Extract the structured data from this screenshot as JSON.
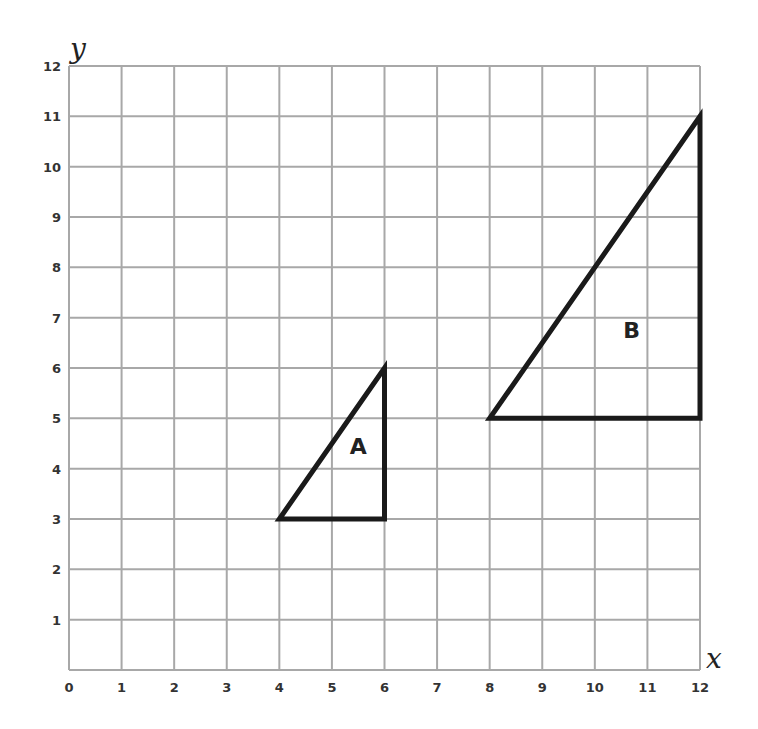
{
  "chart_data": {
    "type": "scatter",
    "title": "",
    "xlabel": "x",
    "ylabel": "y",
    "xlim": [
      0,
      12
    ],
    "ylim": [
      0,
      12
    ],
    "grid": true,
    "x_ticks": [
      "0",
      "1",
      "2",
      "3",
      "4",
      "5",
      "6",
      "7",
      "8",
      "9",
      "10",
      "11",
      "12"
    ],
    "y_ticks": [
      "1",
      "2",
      "3",
      "4",
      "5",
      "6",
      "7",
      "8",
      "9",
      "10",
      "11",
      "12"
    ],
    "shapes": [
      {
        "name": "A",
        "kind": "triangle",
        "vertices": [
          [
            4,
            3
          ],
          [
            6,
            3
          ],
          [
            6,
            6
          ]
        ],
        "label_pos": [
          5.5,
          4.3
        ]
      },
      {
        "name": "B",
        "kind": "triangle",
        "vertices": [
          [
            8,
            5
          ],
          [
            12,
            5
          ],
          [
            12,
            11
          ]
        ],
        "label_pos": [
          10.7,
          6.6
        ]
      }
    ]
  },
  "colors": {
    "grid": "#a8a8a8",
    "shape_stroke": "#1a1a1a",
    "text": "#333333"
  },
  "axes": {
    "x_name": "x",
    "y_name": "y"
  }
}
